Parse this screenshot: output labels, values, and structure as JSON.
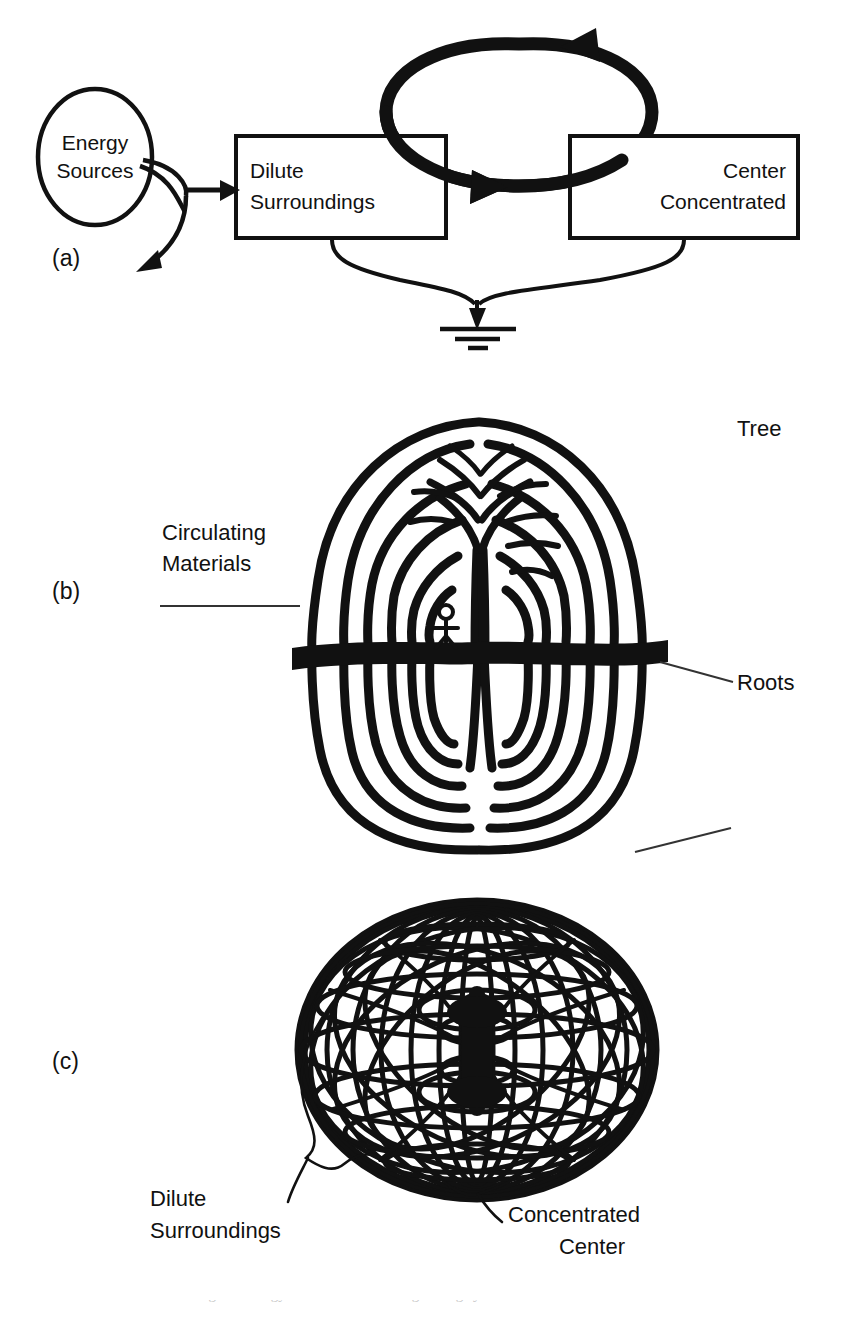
{
  "figure": {
    "type": "scientific-diagram",
    "background_color": "#ffffff",
    "ink_color": "#111111",
    "panels": [
      {
        "id": "a",
        "marker": "(a)",
        "description": "energy systems block diagram: energy source feeds dilute surroundings and center concentrated, with circulating loop and heat sink"
      },
      {
        "id": "b",
        "marker": "(b)",
        "description": "tree with circulating material loops above and below ground line, roots below"
      },
      {
        "id": "c",
        "marker": "(c)",
        "description": "toroidal vortex mesh of circulation paths converging on a concentrated center"
      }
    ]
  },
  "panel_a": {
    "marker": "(a)",
    "source_label_line1": "Energy",
    "source_label_line2": "Sources",
    "box_left_line1": "Dilute",
    "box_left_line2": "Surroundings",
    "box_right_line1": "Center",
    "box_right_line2": "Concentrated",
    "icons": {
      "source": "ellipse-source-icon",
      "loop": "circulation-loop-icon",
      "ground": "heat-sink-ground-icon",
      "inflow_arrow": "inflow-arrow-icon",
      "dispersal_arrow": "dispersal-arrow-icon"
    }
  },
  "panel_b": {
    "marker": "(b)",
    "label_tree": "Tree",
    "label_roots": "Roots",
    "label_circulating_line1": "Circulating",
    "label_circulating_line2": "Materials",
    "icons": {
      "tree": "tree-icon",
      "ground": "ground-line-icon",
      "person": "stick-figure-icon",
      "leader": "leader-line-icon"
    }
  },
  "panel_c": {
    "marker": "(c)",
    "label_dilute_line1": "Dilute",
    "label_dilute_line2": "Surroundings",
    "label_center_line1": "Concentrated",
    "label_center_line2": "Center",
    "icons": {
      "torus": "toroidal-mesh-icon",
      "bracket_left": "curly-leader-left-icon",
      "bracket_right": "curly-leader-right-icon"
    }
  },
  "caption": {
    "partial_text": "Figure. Energy circulation in self-organizing systems."
  }
}
